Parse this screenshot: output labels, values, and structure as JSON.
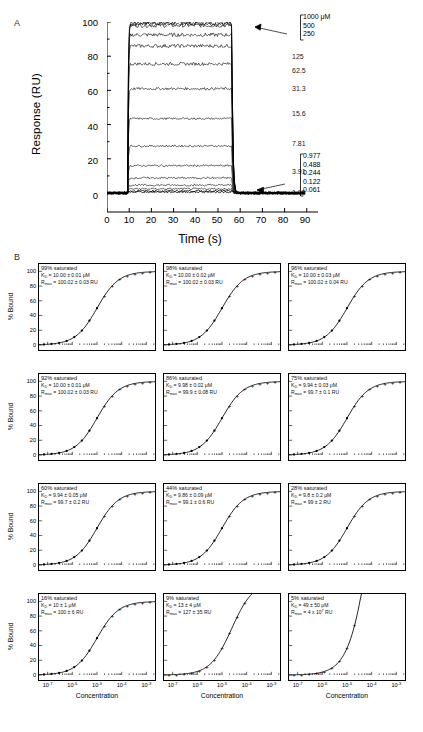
{
  "figure": {
    "panels": [
      {
        "letter": "A"
      },
      {
        "letter": "B"
      }
    ]
  },
  "panel_a": {
    "letter": "A",
    "ylabel": "Response (RU)",
    "xlabel": "Time (s)",
    "yticks": [
      "0",
      "20",
      "40",
      "60",
      "80",
      "100"
    ],
    "xticks": [
      "0",
      "10",
      "20",
      "30",
      "40",
      "50",
      "60",
      "70",
      "80",
      "90"
    ],
    "top_bracket": [
      "1000 μM",
      "500",
      "250"
    ],
    "bottom_bracket": [
      "0.977",
      "0.488",
      "0.244",
      "0.122",
      "0.061"
    ],
    "curve_labels": [
      "125",
      "62.5",
      "31.3",
      "15.6",
      "7.81",
      "3.91",
      "1.95"
    ],
    "chart_data": {
      "type": "line",
      "title": "SPR sensorgram",
      "xlabel": "Time (s)",
      "ylabel": "Response (RU)",
      "xlim": [
        0,
        95
      ],
      "ylim": [
        -4,
        104
      ],
      "grid": false,
      "legend_position": "right-inline",
      "injection_start_s": 10,
      "injection_end_s": 60,
      "series": [
        {
          "name": "1000 μM",
          "plateau_ru": 99.5,
          "concentration_uM": 1000
        },
        {
          "name": "500",
          "plateau_ru": 99.0,
          "concentration_uM": 500
        },
        {
          "name": "250",
          "plateau_ru": 98.0,
          "concentration_uM": 250
        },
        {
          "name": "125",
          "plateau_ru": 92.5,
          "concentration_uM": 125
        },
        {
          "name": "62.5",
          "plateau_ru": 86.0,
          "concentration_uM": 62.5
        },
        {
          "name": "31.3",
          "plateau_ru": 75.5,
          "concentration_uM": 31.3
        },
        {
          "name": "15.6",
          "plateau_ru": 61.0,
          "concentration_uM": 15.6
        },
        {
          "name": "7.81",
          "plateau_ru": 43.5,
          "concentration_uM": 7.81
        },
        {
          "name": "3.91",
          "plateau_ru": 27.5,
          "concentration_uM": 3.91
        },
        {
          "name": "1.95",
          "plateau_ru": 16.0,
          "concentration_uM": 1.95
        },
        {
          "name": "0.977",
          "plateau_ru": 8.8,
          "concentration_uM": 0.977
        },
        {
          "name": "0.488",
          "plateau_ru": 4.6,
          "concentration_uM": 0.488
        },
        {
          "name": "0.244",
          "plateau_ru": 2.4,
          "concentration_uM": 0.244
        },
        {
          "name": "0.122",
          "plateau_ru": 1.2,
          "concentration_uM": 0.122
        },
        {
          "name": "0.061",
          "plateau_ru": 0.6,
          "concentration_uM": 0.061
        }
      ]
    }
  },
  "panel_b": {
    "letter": "B",
    "ylabel": "% Bound",
    "xlabel": "Concentration",
    "yticks": [
      "100",
      "80",
      "60",
      "40",
      "20",
      "0"
    ],
    "xticks": [
      "10-7",
      "10-6",
      "10-5",
      "10-4",
      "10-3"
    ],
    "xtick_mantissa": "10",
    "xtick_exponents": [
      "-7",
      "-6",
      "-5",
      "-4",
      "-3"
    ],
    "subplots": [
      {
        "saturation": "99% saturated",
        "kd": "K_D = 10.00 ± 0.01 μM",
        "kd_value": "10.00 ± 0.01",
        "rmax": "R_max = 100.02 ± 0.03 RU",
        "rmax_value": "100.02 ± 0.03",
        "sat_fraction": 0.99,
        "ec50_log": -5.0,
        "top_pct": 100
      },
      {
        "saturation": "98% saturated",
        "kd": "K_D = 10.00 ± 0.02 μM",
        "kd_value": "10.00 ± 0.02",
        "rmax": "R_max = 100.02 ± 0.03 RU",
        "rmax_value": "100.02 ± 0.03",
        "sat_fraction": 0.98,
        "ec50_log": -5.0,
        "top_pct": 100
      },
      {
        "saturation": "96% saturated",
        "kd": "K_D = 10.00 ± 0.03 μM",
        "kd_value": "10.00 ± 0.03",
        "rmax": "R_max = 100.02 ± 0.04 RU",
        "rmax_value": "100.02 ± 0.04",
        "sat_fraction": 0.96,
        "ec50_log": -5.0,
        "top_pct": 100
      },
      {
        "saturation": "92% saturated",
        "kd": "K_D = 10.00 ± 0.01μM",
        "kd_value": "10.00 ± 0.01",
        "rmax": "R_max = 100.02 ± 0.03 RU",
        "rmax_value": "100.02 ± 0.03",
        "sat_fraction": 0.92,
        "ec50_log": -5.0,
        "top_pct": 100
      },
      {
        "saturation": "86% saturated",
        "kd": "K_D = 9.98 ± 0.02 μM",
        "kd_value": "9.98 ± 0.02",
        "rmax": "R_max = 99.9 ± 0.08 RU",
        "rmax_value": "99.9 ± 0.08",
        "sat_fraction": 0.86,
        "ec50_log": -5.0,
        "top_pct": 100
      },
      {
        "saturation": "75% saturated",
        "kd": "K_D = 9.94 ± 0.03 μM",
        "kd_value": "9.94 ± 0.03",
        "rmax": "R_max = 99.7 ± 0.1 RU",
        "rmax_value": "99.7 ± 0.1",
        "sat_fraction": 0.75,
        "ec50_log": -5.0,
        "top_pct": 100
      },
      {
        "saturation": "60% saturated",
        "kd": "K_D = 9.94 ± 0.05 μM",
        "kd_value": "9.94 ± 0.05",
        "rmax": "R_max = 99.7 ± 0.2 RU",
        "rmax_value": "99.7 ± 0.2",
        "sat_fraction": 0.6,
        "ec50_log": -5.0,
        "top_pct": 100
      },
      {
        "saturation": "44% saturated",
        "kd": "K_D = 9.86 ± 0.09 μM",
        "kd_value": "9.86 ± 0.09",
        "rmax": "R_max = 99.1 ± 0.6 RU",
        "rmax_value": "99.1 ± 0.6",
        "sat_fraction": 0.44,
        "ec50_log": -5.0,
        "top_pct": 100
      },
      {
        "saturation": "28% saturated",
        "kd": "K_D = 9.8 ± 0.2 μM",
        "kd_value": "9.8 ± 0.2",
        "rmax": "R_max = 99 ± 2 RU",
        "rmax_value": "99 ± 2",
        "sat_fraction": 0.28,
        "ec50_log": -5.0,
        "top_pct": 100
      },
      {
        "saturation": "16% saturated",
        "kd": "K_D = 10 ± 1 μM",
        "kd_value": "10 ± 1",
        "rmax": "R_max = 100 ± 6 RU",
        "rmax_value": "100 ± 6",
        "sat_fraction": 0.16,
        "ec50_log": -5.0,
        "top_pct": 100
      },
      {
        "saturation": "9% saturated",
        "kd": "K_D = 13 ± 4 μM",
        "kd_value": "13 ± 4",
        "rmax": "R_max = 127 ± 35 RU",
        "rmax_value": "127 ± 35",
        "sat_fraction": 0.09,
        "ec50_log": -4.6,
        "top_pct": 127
      },
      {
        "saturation": "5% saturated",
        "kd": "K_D = 49 ± 50 μM",
        "kd_value": "49 ± 50",
        "rmax": "R_max = 4 x 107 RU",
        "rmax_value": "4 x 10^7",
        "sat_fraction": 0.05,
        "ec50_log": -4.0,
        "top_pct": 400
      }
    ],
    "chart_data": {
      "type": "line",
      "title": "Binding isotherms at decreasing saturation",
      "xlabel": "Concentration",
      "ylabel": "% Bound",
      "xlim_log": [
        -7.3,
        -2.7
      ],
      "ylim": [
        0,
        110
      ],
      "grid": false,
      "legend_position": "in-plot annotation",
      "panels_count": 12,
      "categories": [
        "99%",
        "98%",
        "96%",
        "92%",
        "86%",
        "75%",
        "60%",
        "44%",
        "28%",
        "16%",
        "9%",
        "5%"
      ],
      "values": [
        99,
        98,
        96,
        92,
        86,
        75,
        60,
        44,
        28,
        16,
        9,
        5
      ]
    }
  }
}
